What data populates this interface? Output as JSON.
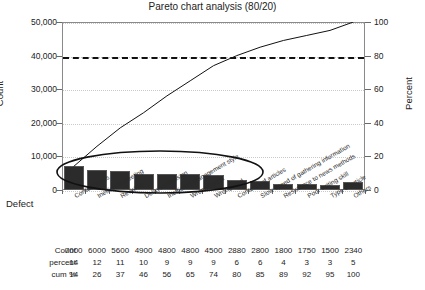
{
  "chart_data": {
    "type": "bar",
    "title": "Pareto chart analysis (80/20)",
    "xlabel": "Defect",
    "ylabel": "Count",
    "y2label": "Percent",
    "ylim": [
      0,
      50000
    ],
    "y2lim": [
      0,
      100
    ],
    "grid": true,
    "legend": "none",
    "reference_line": {
      "value": 80,
      "axis": "percent",
      "style": "dashed"
    },
    "annotation": {
      "shape": "ellipse",
      "covers": "first 8 bars",
      "meaning": "vital few"
    },
    "categories": [
      "Contact times",
      "Inefficient meeting",
      "Revision",
      "Delayed decision",
      "Inefficient management style",
      "Wrong layout",
      "Wrong lead",
      "Contents of articles",
      "Slow speed of gathering information",
      "Resistance to news methods",
      "Poor writing skill",
      "Type of article",
      "Others"
    ],
    "values": [
      7000,
      6000,
      5600,
      4900,
      4800,
      4800,
      4500,
      2880,
      2800,
      1800,
      1750,
      1500,
      2340
    ],
    "percent": [
      14,
      12,
      11,
      10,
      9,
      9,
      9,
      6,
      6,
      4,
      3,
      3,
      5
    ],
    "cumulative": [
      14,
      26,
      37,
      46,
      56,
      65,
      74,
      80,
      85,
      89,
      92,
      95,
      100
    ],
    "yticks": [
      "0",
      "10,000",
      "20,000",
      "30,000",
      "40,000",
      "50,000"
    ],
    "y2ticks": [
      "0",
      "20",
      "40",
      "60",
      "80",
      "100"
    ],
    "colors": {
      "bar": "#2b2b2b",
      "line": "#111111",
      "grid": "#c9c9c9",
      "frame": "#8a8a8a"
    }
  },
  "table": {
    "rows": [
      {
        "label": "Count",
        "values": [
          "7000",
          "6000",
          "5600",
          "4900",
          "4800",
          "4800",
          "4500",
          "2880",
          "2800",
          "1800",
          "1750",
          "1500",
          "2340"
        ]
      },
      {
        "label": "percent",
        "values": [
          "14",
          "12",
          "11",
          "10",
          "9",
          "9",
          "9",
          "6",
          "6",
          "4",
          "3",
          "3",
          "5"
        ]
      },
      {
        "label": "cum %",
        "values": [
          "14",
          "26",
          "37",
          "46",
          "56",
          "65",
          "74",
          "80",
          "85",
          "89",
          "92",
          "95",
          "100"
        ]
      }
    ]
  }
}
